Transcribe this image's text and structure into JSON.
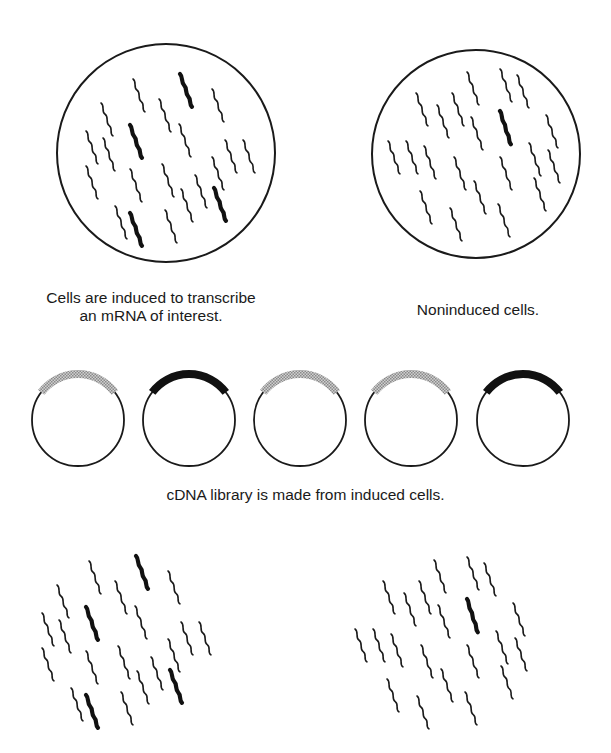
{
  "figure": {
    "panels": {
      "induced_cells": {
        "label_line1": "Cells are induced to transcribe",
        "label_line2": "an mRNA of interest.",
        "circle": {
          "cx": 166,
          "cy": 153,
          "r": 109
        },
        "mrna_thin_count": 17,
        "mrna_thick_count": 4
      },
      "noninduced_cells": {
        "label": "Noninduced cells.",
        "circle": {
          "cx": 476,
          "cy": 154,
          "r": 104
        },
        "mrna_thin_count": 24,
        "mrna_thick_count": 1
      }
    },
    "cdna_library": {
      "label": "cDNA library is made from induced cells.",
      "plasmids": [
        {
          "cx": 78,
          "insert": "hatched"
        },
        {
          "cx": 189,
          "insert": "solid"
        },
        {
          "cx": 300,
          "insert": "hatched"
        },
        {
          "cx": 411,
          "insert": "hatched"
        },
        {
          "cx": 523,
          "insert": "solid"
        }
      ],
      "plasmid_cy": 420,
      "plasmid_r": 46
    },
    "colors": {
      "ink": "#1a1a1a",
      "hatched_insert": "#a8a8a8",
      "solid_insert": "#111111",
      "background": "#ffffff"
    }
  }
}
